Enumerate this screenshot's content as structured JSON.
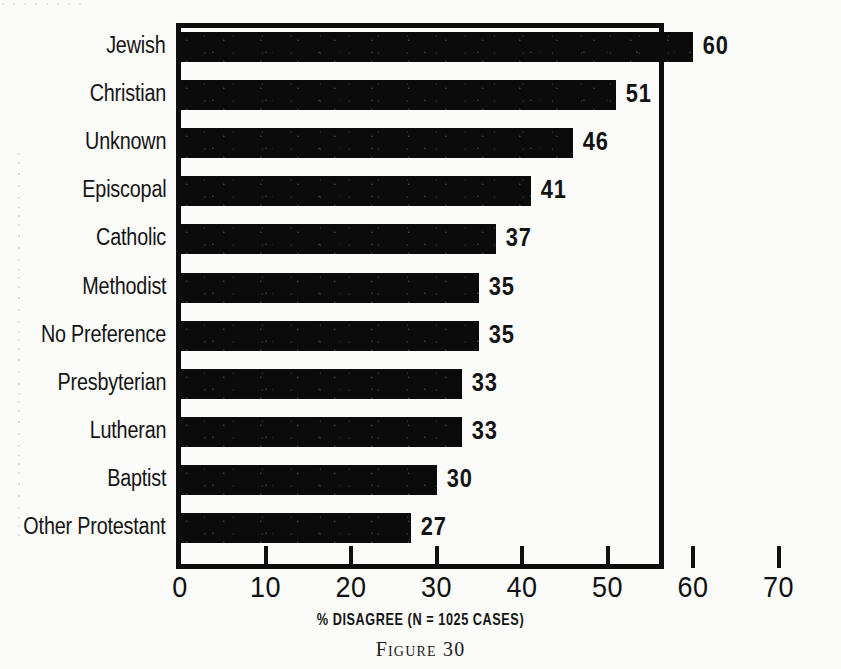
{
  "chart_data": {
    "type": "bar",
    "orientation": "horizontal",
    "title": "",
    "xlabel": "% DISAGREE (N = 1025 CASES)",
    "ylabel": "",
    "xlim": [
      0,
      75
    ],
    "xticks": [
      0,
      10,
      20,
      30,
      40,
      50,
      60,
      70
    ],
    "xtick_labels": [
      "0",
      "10",
      "20",
      "30",
      "40",
      "50",
      "60",
      "70"
    ],
    "grid": false,
    "legend": null,
    "bar_color": "#0b0b0b",
    "categories": [
      "Jewish",
      "Christian",
      "Unknown",
      "Episcopal",
      "Catholic",
      "Methodist",
      "No Preference",
      "Presbyterian",
      "Lutheran",
      "Baptist",
      "Other Protestant"
    ],
    "values": [
      60,
      51,
      46,
      41,
      37,
      35,
      35,
      33,
      33,
      30,
      27
    ],
    "value_labels": [
      "60",
      "51",
      "46",
      "41",
      "37",
      "35",
      "35",
      "33",
      "33",
      "30",
      "27"
    ]
  },
  "caption": {
    "figure_label": "Figure 30"
  }
}
